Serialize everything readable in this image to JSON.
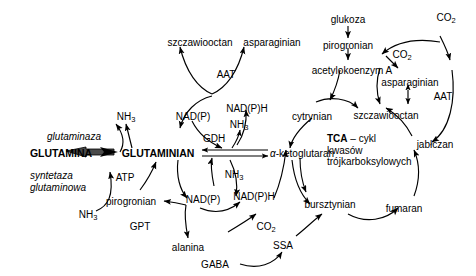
{
  "metabolites": {
    "szczawiooctan_left": "szczawiooctan",
    "asparaginian_left": "asparaginian",
    "nh3_top_left": "NH3",
    "glutamina": "GLUTAMINA",
    "glutaminian": "GLUTAMINIAN",
    "atp": "ATP",
    "nh3_bottom_left": "NH3",
    "pirogronian_left": "pirogronian",
    "alanina": "alanina",
    "nadp_upper_left": "NAD(P)",
    "nadph_upper_right": "NAD(P)H",
    "nh3_gdh_upper": "NH3",
    "nh3_gdh_lower": "NH3",
    "nadp_lower_left": "NAD(P)",
    "nadph_lower_right": "NAD(P)H",
    "alpha_ketoglutaran": "α-ketoglutaran",
    "co2_center": "CO2",
    "gaba": "GABA",
    "ssa": "SSA",
    "bursztynian": "bursztynian",
    "fumaran": "fumaran",
    "jablczan": "jabłczan",
    "szczawiooctan_right": "szczawiooctan",
    "asparaginian_right": "asparaginian",
    "cytrynian": "cytrynian",
    "acetylokoenzym": "acetylokoenzym A",
    "pirogronian_right": "pirogronian",
    "glukoza": "glukoza",
    "co2_right_top": "CO2",
    "co2_right_mid": "CO2"
  },
  "enzymes": {
    "aat_left": "AAT",
    "aat_right": "AAT",
    "gdh": "GDH",
    "gpt": "GPT",
    "glutaminaza": "glutaminaza",
    "syntetaza_glutaminowa": "syntetaza\nglutaminowa"
  },
  "cycle_label": {
    "abbrev": "TCA",
    "dash": " – cykl",
    "line2": "kwasów",
    "line3": "trójkarboksylowych"
  },
  "colors": {
    "stroke": "#000000",
    "text": "#000000",
    "background": "#ffffff",
    "thick_arrow": "#4a4a4a"
  }
}
